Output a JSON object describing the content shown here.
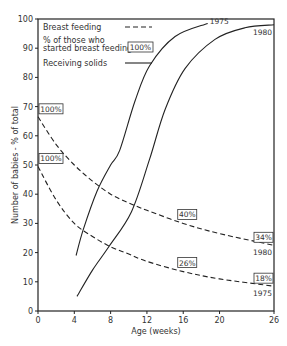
{
  "chart_data": {
    "type": "line",
    "title": "",
    "xlabel": "Age (weeks)",
    "ylabel": "Number of babies - % of total",
    "xlim": [
      0,
      26
    ],
    "ylim": [
      0,
      100
    ],
    "xticks": [
      0,
      4,
      8,
      12,
      16,
      20,
      26
    ],
    "yticks": [
      0,
      10,
      20,
      30,
      40,
      50,
      60,
      70,
      80,
      90,
      100
    ],
    "grid": false,
    "legend": {
      "placement": "top-left",
      "entries": [
        {
          "label": "Breast feeding",
          "style": "dashed"
        },
        {
          "label": "% of those who started breast feeding",
          "style": "box",
          "box_text": "100%"
        },
        {
          "label": "Receiving solids",
          "style": "solid"
        }
      ]
    },
    "series": [
      {
        "name": "Breast feeding 1980",
        "style": "dashed",
        "x": [
          0,
          2,
          4,
          6,
          8,
          10,
          12,
          16,
          20,
          26
        ],
        "y": [
          66.5,
          57,
          50,
          44.5,
          40,
          37,
          34.5,
          30,
          26.5,
          22.5
        ],
        "end_label": "1980"
      },
      {
        "name": "Breast feeding 1975",
        "style": "dashed",
        "x": [
          0,
          2,
          4,
          6,
          8,
          10,
          12,
          16,
          20,
          26
        ],
        "y": [
          49.5,
          38,
          30,
          25.5,
          22,
          19.5,
          17,
          13.5,
          11,
          8.5
        ],
        "end_label": "1975"
      },
      {
        "name": "Receiving solids 1975",
        "style": "solid",
        "x": [
          4.2,
          5,
          6.5,
          8,
          9,
          10.7,
          12.3,
          15.1,
          18.7
        ],
        "y": [
          19,
          28,
          41,
          50,
          55,
          72,
          84,
          94,
          98.5
        ],
        "end_label": "1975"
      },
      {
        "name": "Receiving solids 1980",
        "style": "solid",
        "x": [
          4.3,
          6,
          7.8,
          10.3,
          12.3,
          14,
          16.2,
          19.5,
          22.8,
          26
        ],
        "y": [
          5,
          14,
          22,
          34,
          52,
          69,
          83,
          93,
          97,
          98
        ],
        "end_label": "1980"
      }
    ],
    "annotations": [
      {
        "text": "100%",
        "series": "Breast feeding 1980",
        "x": 0,
        "y": 66.5
      },
      {
        "text": "100%",
        "series": "Breast feeding 1975",
        "x": 0,
        "y": 49.5
      },
      {
        "text": "40%",
        "series": "Breast feeding 1980",
        "x": 16,
        "y": 30
      },
      {
        "text": "26%",
        "series": "Breast feeding 1975",
        "x": 16,
        "y": 13.5
      },
      {
        "text": "34%",
        "series": "Breast feeding 1980",
        "x": 26,
        "y": 22.5
      },
      {
        "text": "18%",
        "series": "Breast feeding 1975",
        "x": 26,
        "y": 8.5
      }
    ]
  }
}
